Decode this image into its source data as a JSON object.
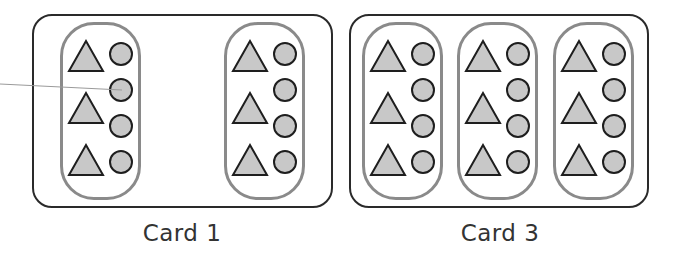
{
  "colors": {
    "card_border": "#2a2a2a",
    "group_border": "#8a8a8a",
    "shape_fill": "#c8c8c8",
    "shape_stroke": "#1e1e1e",
    "pointer_line": "#9a9a9a",
    "label_text": "#333333"
  },
  "cards": [
    {
      "label": "Card 1",
      "groups": 2,
      "triangles_per_group": 3,
      "circles_per_group": 4
    },
    {
      "label": "Card 3",
      "groups": 3,
      "triangles_per_group": 3,
      "circles_per_group": 4
    }
  ],
  "pointer": {
    "from": [
      0,
      84
    ],
    "to": [
      122,
      90
    ]
  }
}
